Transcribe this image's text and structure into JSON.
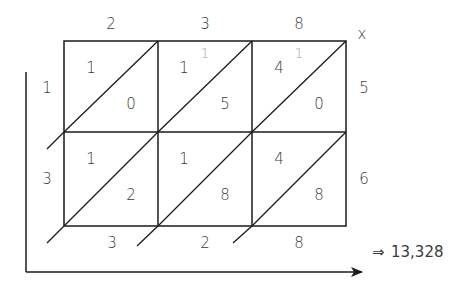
{
  "diagram": {
    "type": "lattice-multiplication",
    "multiplicand_digits": [
      "2",
      "3",
      "8"
    ],
    "multiplier_digits": [
      "5",
      "6"
    ],
    "operator": "x",
    "left_labels": [
      "1",
      "3"
    ],
    "cells": [
      [
        {
          "tens": "1",
          "ones": "0",
          "carry": ""
        },
        {
          "tens": "1",
          "ones": "5",
          "carry": "1"
        },
        {
          "tens": "4",
          "ones": "0",
          "carry": "1"
        }
      ],
      [
        {
          "tens": "1",
          "ones": "2",
          "carry": ""
        },
        {
          "tens": "1",
          "ones": "8",
          "carry": ""
        },
        {
          "tens": "4",
          "ones": "8",
          "carry": ""
        }
      ]
    ],
    "bottom_labels": [
      "3",
      "2",
      "8"
    ],
    "result_arrow": "⇒",
    "result": "13,328",
    "colors": {
      "line": "#1a1a1a",
      "text": "#3a3a3a",
      "carry": "#a8a8a8"
    }
  }
}
